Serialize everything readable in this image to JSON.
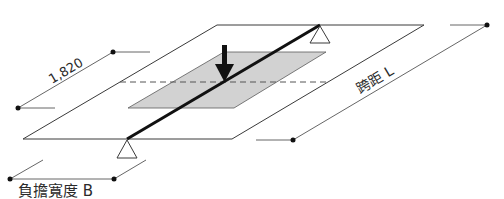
{
  "diagram": {
    "type": "isometric structural load diagram",
    "labels": {
      "dimension_top": "1,820",
      "span": "跨距 L",
      "load_width": "負擔寬度 B"
    },
    "colors": {
      "line": "#3a3a3a",
      "beam": "#111111",
      "shaded_area": "#d2d2d2",
      "background": "#ffffff"
    },
    "elements": [
      "outer-floor-plate",
      "tributary-load-area",
      "beam",
      "support-left",
      "support-right",
      "point-load-arrow",
      "centerline-dashed",
      "dimension-1820",
      "dimension-span-L",
      "dimension-width-B"
    ]
  }
}
